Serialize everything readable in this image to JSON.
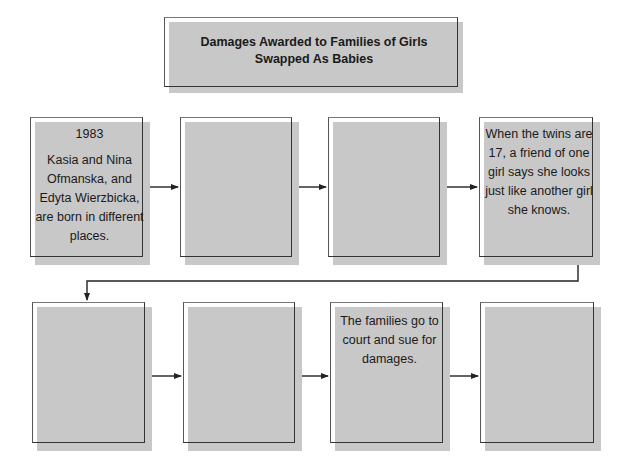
{
  "title": {
    "line1": "Damages Awarded to Families of Girls",
    "line2": "Swapped As Babies"
  },
  "colors": {
    "box_fill": "#c8c8c8",
    "line": "#222222"
  },
  "row1": [
    {
      "year": "1983",
      "text": "Kasia and Nina Ofmanska, and Edyta Wierzbicka, are born in different places."
    },
    {
      "text": ""
    },
    {
      "text": ""
    },
    {
      "text": "When the twins are 17, a friend of one girl says she looks just like another girl she knows."
    }
  ],
  "row2": [
    {
      "text": ""
    },
    {
      "text": ""
    },
    {
      "text": "The families go to court and sue for damages."
    },
    {
      "text": ""
    }
  ]
}
